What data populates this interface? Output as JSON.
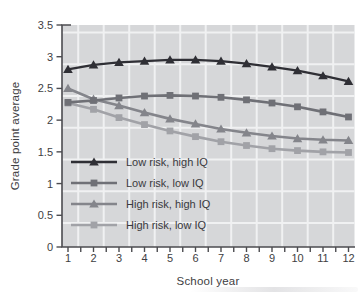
{
  "colors": {
    "background": "#ffffff",
    "panel": "#d6d7d9",
    "grid": "#f0f1f2",
    "axis": "#4c4c50",
    "text": "#3e3e42"
  },
  "chart_data": {
    "type": "line",
    "title": "",
    "xlabel": "School year",
    "ylabel": "Grade point average",
    "x": [
      1,
      2,
      3,
      4,
      5,
      6,
      7,
      8,
      9,
      10,
      11,
      12
    ],
    "xlim": [
      0.75,
      12.3
    ],
    "ylim": [
      0,
      3.5
    ],
    "yticks": [
      "0",
      "0.5",
      "1",
      "1.5",
      "2",
      "2.5",
      "3",
      "3.5"
    ],
    "ytick_values": [
      0,
      0.5,
      1,
      1.5,
      2,
      2.5,
      3,
      3.5
    ],
    "xtick_minor_step": 0.5,
    "grid": true,
    "legend_position": "inside-lower-left",
    "series": [
      {
        "name": "Low risk, high IQ",
        "marker": "triangle",
        "color": "#2f2f35",
        "values": [
          2.8,
          2.87,
          2.91,
          2.93,
          2.95,
          2.95,
          2.93,
          2.89,
          2.84,
          2.78,
          2.7,
          2.61
        ]
      },
      {
        "name": "Low risk, low IQ",
        "marker": "square",
        "color": "#6f7076",
        "values": [
          2.28,
          2.31,
          2.35,
          2.38,
          2.39,
          2.38,
          2.36,
          2.32,
          2.27,
          2.21,
          2.13,
          2.05
        ]
      },
      {
        "name": "High risk, high IQ",
        "marker": "triangle",
        "color": "#84858b",
        "values": [
          2.5,
          2.33,
          2.23,
          2.12,
          2.02,
          1.94,
          1.86,
          1.8,
          1.75,
          1.71,
          1.69,
          1.68
        ]
      },
      {
        "name": "High risk, low IQ",
        "marker": "square",
        "color": "#a1a2a7",
        "values": [
          2.27,
          2.17,
          2.04,
          1.93,
          1.83,
          1.74,
          1.66,
          1.6,
          1.55,
          1.52,
          1.5,
          1.49
        ]
      }
    ]
  }
}
